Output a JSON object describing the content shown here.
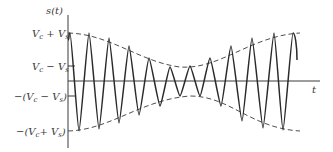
{
  "figure": {
    "type": "amplitude-modulated waveform",
    "y_axis_label": "s(t)",
    "x_axis_label": "t",
    "y_ticks": [
      {
        "label": "V_c + V_s",
        "text_main": "V",
        "sub1": "c",
        "mid": " + V",
        "sub2": "s",
        "y": 33
      },
      {
        "label": "V_c − V_s",
        "text_main": "V",
        "sub1": "c",
        "mid": " − V",
        "sub2": "s",
        "y": 66
      },
      {
        "label": "−(V_c − V_s)",
        "text_pre": "−(V",
        "sub1": "c",
        "mid": " − V",
        "sub2": "s",
        "post": ")",
        "y": 96
      },
      {
        "label": "−(V_c + V_s)",
        "text_pre": "−(V",
        "sub1": "c",
        "mid": "+ V",
        "sub2": "s",
        "post": ")",
        "y": 131
      }
    ],
    "colors": {
      "line": "#2a2a2a",
      "axis": "#3a3a3a",
      "envelope": "#3a3a3a",
      "background": "#ffffff"
    },
    "envelope_style": "dashed",
    "carrier_peaks": [
      [
        70,
        33
      ],
      [
        89,
        33
      ],
      [
        109,
        38
      ],
      [
        129,
        46
      ],
      [
        149,
        58
      ],
      [
        170,
        67
      ],
      [
        190,
        66
      ],
      [
        210,
        58
      ],
      [
        231,
        46
      ],
      [
        252,
        38
      ],
      [
        274,
        33
      ],
      [
        293,
        33
      ]
    ],
    "carrier_troughs": [
      [
        79,
        131
      ],
      [
        99,
        129
      ],
      [
        119,
        123
      ],
      [
        139,
        115
      ],
      [
        160,
        106
      ],
      [
        180,
        96
      ],
      [
        200,
        96
      ],
      [
        221,
        106
      ],
      [
        242,
        121
      ],
      [
        263,
        128
      ],
      [
        283,
        130
      ]
    ]
  }
}
